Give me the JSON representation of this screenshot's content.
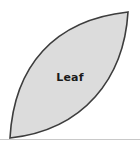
{
  "figure": {
    "type": "geometric-shape-diagram",
    "canvas": {
      "width": 140,
      "height": 158,
      "background_color": "#ffffff"
    },
    "shape": {
      "name": "leaf",
      "label": "Leaf",
      "description": "Lens / vesica 'leaf' shape formed by two circular arcs meeting at a bottom-left cusp and a top-right cusp",
      "fill_color": "#dcdcdc",
      "stroke_color": "#3d3d3d",
      "stroke_width": 1.6,
      "cusp_bottom_left": {
        "x": 10,
        "y": 138
      },
      "cusp_top_right": {
        "x": 128,
        "y": 12
      },
      "upper_arc_control": {
        "x": 14,
        "y": 20
      },
      "lower_arc_control": {
        "x": 124,
        "y": 130
      },
      "label_position": {
        "x": 62,
        "y": 78
      }
    },
    "baseline": {
      "name": "baseline",
      "color": "#c9c9c9",
      "y": 139,
      "x_start": 0,
      "x_end": 140,
      "stroke_width": 1
    }
  }
}
